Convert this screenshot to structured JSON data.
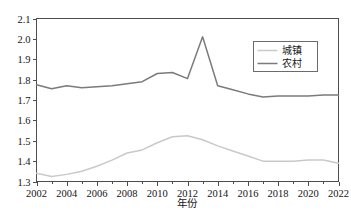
{
  "chart_data": {
    "type": "line",
    "title": "",
    "xlabel": "年份",
    "ylabel": "",
    "xlim": [
      2002,
      2022
    ],
    "ylim": [
      1.3,
      2.1
    ],
    "grid": false,
    "legend_position": "top-right",
    "x": [
      2002,
      2003,
      2004,
      2005,
      2006,
      2007,
      2008,
      2009,
      2010,
      2011,
      2012,
      2013,
      2014,
      2015,
      2016,
      2017,
      2018,
      2019,
      2020,
      2021,
      2022
    ],
    "categories": [
      "2002",
      "2003",
      "2004",
      "2005",
      "2006",
      "2007",
      "2008",
      "2009",
      "2010",
      "2011",
      "2012",
      "2013",
      "2014",
      "2015",
      "2016",
      "2017",
      "2018",
      "2019",
      "2020",
      "2021",
      "2022"
    ],
    "xticks": [
      "2002",
      "2004",
      "2006",
      "2008",
      "2010",
      "2012",
      "2014",
      "2016",
      "2018",
      "2020",
      "2022"
    ],
    "xtick_values": [
      2002,
      2004,
      2006,
      2008,
      2010,
      2012,
      2014,
      2016,
      2018,
      2020,
      2022
    ],
    "yticks": [
      "1.3",
      "1.4",
      "1.5",
      "1.6",
      "1.7",
      "1.8",
      "1.9",
      "2.0",
      "2.1"
    ],
    "ytick_values": [
      1.3,
      1.4,
      1.5,
      1.6,
      1.7,
      1.8,
      1.9,
      2.0,
      2.1
    ],
    "series": [
      {
        "name": "城镇",
        "color": "#c9c9c9",
        "values": [
          1.34,
          1.325,
          1.335,
          1.35,
          1.375,
          1.405,
          1.44,
          1.455,
          1.49,
          1.52,
          1.525,
          1.505,
          1.475,
          1.45,
          1.425,
          1.4,
          1.4,
          1.4,
          1.405,
          1.405,
          1.39
        ]
      },
      {
        "name": "农村",
        "color": "#7b7b7b",
        "values": [
          1.775,
          1.755,
          1.77,
          1.76,
          1.765,
          1.77,
          1.78,
          1.79,
          1.83,
          1.835,
          1.805,
          2.01,
          1.77,
          1.75,
          1.73,
          1.715,
          1.72,
          1.72,
          1.72,
          1.725,
          1.725
        ]
      }
    ]
  },
  "legend": {
    "entries": [
      {
        "label": "城镇"
      },
      {
        "label": "农村"
      }
    ]
  },
  "axes": {
    "x_title": "年份"
  }
}
